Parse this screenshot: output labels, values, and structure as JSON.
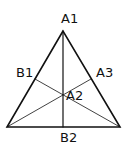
{
  "diagram": {
    "type": "triangle-with-medians",
    "labels": {
      "a1": "A1",
      "a2": "A2",
      "a3": "A3",
      "b1": "B1",
      "b2": "B2"
    },
    "colors": {
      "stroke": "#111111",
      "background": "#ffffff"
    }
  }
}
